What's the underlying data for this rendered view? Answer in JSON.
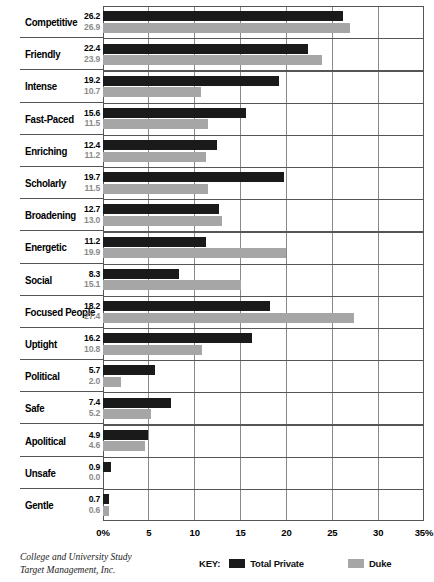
{
  "chart_data": {
    "type": "bar",
    "orientation": "horizontal",
    "title": "",
    "xlabel": "",
    "ylabel": "",
    "xlim": [
      0,
      35
    ],
    "xticks": [
      "0%",
      "5",
      "10",
      "15",
      "20",
      "25",
      "30",
      "35%"
    ],
    "xtick_values": [
      0,
      5,
      10,
      15,
      20,
      25,
      30,
      35
    ],
    "grid": true,
    "legend_position": "bottom-right",
    "categories": [
      "Competitive",
      "Friendly",
      "Intense",
      "Fast-Paced",
      "Enriching",
      "Scholarly",
      "Broadening",
      "Energetic",
      "Social",
      "Focused People",
      "Uptight",
      "Political",
      "Safe",
      "Apolitical",
      "Unsafe",
      "Gentle"
    ],
    "series": [
      {
        "name": "Total Private",
        "color": "#1a1a1a",
        "values": [
          26.2,
          22.4,
          19.2,
          15.6,
          12.4,
          19.7,
          12.7,
          11.2,
          8.3,
          18.2,
          16.2,
          5.7,
          7.4,
          4.9,
          0.9,
          0.7
        ],
        "labels": [
          "26.2",
          "22.4",
          "19.2",
          "15.6",
          "12.4",
          "19.7",
          "12.7",
          "11.2",
          "8.3",
          "18.2",
          "16.2",
          "5.7",
          "7.4",
          "4.9",
          "0.9",
          "0.7"
        ]
      },
      {
        "name": "Duke",
        "color": "#a6a6a6",
        "values": [
          26.9,
          23.9,
          10.7,
          11.5,
          11.2,
          11.5,
          13.0,
          19.9,
          15.1,
          27.4,
          10.8,
          2.0,
          5.2,
          4.6,
          0.0,
          0.6
        ],
        "labels": [
          "26.9",
          "23.9",
          "10.7",
          "11.5",
          "11.2",
          "11.5",
          "13.0",
          "19.9",
          "15.1",
          "27.4",
          "10.8",
          "2.0",
          "5.2",
          "4.6",
          "0.0",
          "0.6"
        ]
      }
    ]
  },
  "legend": {
    "key_label": "KEY:",
    "entries": [
      {
        "label": "Total Private",
        "color": "#1a1a1a"
      },
      {
        "label": "Duke",
        "color": "#a6a6a6"
      }
    ]
  },
  "source": {
    "line1": "College and University Study",
    "line2": "Target Management, Inc."
  }
}
